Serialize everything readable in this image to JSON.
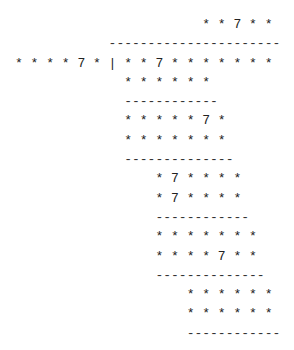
{
  "puzzle": {
    "title": "Cryptarithm long division",
    "divisor": "* * * * 7 *",
    "separator": "|",
    "dividend": "* * 7 * * * * * * *",
    "quotient": "* * 7 * *",
    "lines": [
      {
        "indent": 24,
        "text": "* * 7 * *",
        "kind": "quotient"
      },
      {
        "indent": 12,
        "text": "----------------------",
        "kind": "rule"
      },
      {
        "indent": 0,
        "text": "* * * * 7 * | * * 7 * * * * * * *",
        "kind": "divisor-dividend"
      },
      {
        "indent": 14,
        "text": "* * * * * *",
        "kind": "product"
      },
      {
        "indent": 14,
        "text": "------------",
        "kind": "rule"
      },
      {
        "indent": 14,
        "text": "* * * * * 7 *",
        "kind": "remainder"
      },
      {
        "indent": 14,
        "text": "* * * * * * *",
        "kind": "product"
      },
      {
        "indent": 14,
        "text": "--------------",
        "kind": "rule"
      },
      {
        "indent": 18,
        "text": "* 7 * * * *",
        "kind": "remainder"
      },
      {
        "indent": 18,
        "text": "* 7 * * * *",
        "kind": "product"
      },
      {
        "indent": 18,
        "text": "------------",
        "kind": "rule"
      },
      {
        "indent": 18,
        "text": "* * * * * * *",
        "kind": "remainder"
      },
      {
        "indent": 18,
        "text": "* * * * 7 * *",
        "kind": "product"
      },
      {
        "indent": 18,
        "text": "--------------",
        "kind": "rule"
      },
      {
        "indent": 22,
        "text": "* * * * * *",
        "kind": "remainder"
      },
      {
        "indent": 22,
        "text": "* * * * * *",
        "kind": "product"
      },
      {
        "indent": 22,
        "text": "------------",
        "kind": "rule"
      }
    ]
  }
}
